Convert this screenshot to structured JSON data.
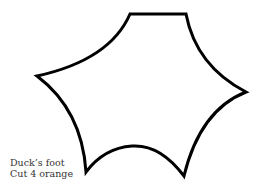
{
  "caption": {
    "line1": "Duck’s foot",
    "line2": "Cut 4 orange"
  },
  "shape": {
    "name": "duck-foot-template",
    "stroke_color": "#000000",
    "fill_color": "#ffffff"
  }
}
